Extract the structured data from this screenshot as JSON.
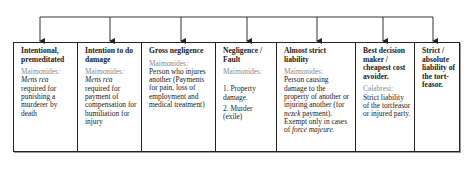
{
  "diagram": {
    "type": "liability-spectrum",
    "connector": {
      "top_line_y": 17,
      "arrow_xs": [
        40,
        110,
        181,
        247,
        317,
        383,
        433
      ]
    },
    "columns": [
      {
        "title": "Intentional, premeditated",
        "source": "Maimonides:",
        "body_italic": "Mens rea",
        "body": "required for punishing a murderer by death"
      },
      {
        "title": "Intention to do damage",
        "source": "Maimonides:",
        "body_italic": "Mens rea",
        "body": "required for payment of compensation for humiliation for injury"
      },
      {
        "title": "Gross negligence",
        "source": "Maimonides:",
        "body": "Person who injures another (Payments for pain, loss of employment and medical treatment)"
      },
      {
        "title": "Negligence / Fault",
        "source": "Maimonides:",
        "items": [
          "1. Property damage.",
          "2. Murder (exile)"
        ]
      },
      {
        "title": "Almost strict liability",
        "source": "Maimonides:",
        "body_pre": "Person causing damage to the property of another or injuring another (for ",
        "body_italic": "nezek",
        "body_post": " payment). Exempt only in cases of ",
        "body_italic2": "force majeure."
      },
      {
        "title": "Best decision maker / cheapest cost avoider.",
        "source": "Calabresi:",
        "body": "Strict liability of the tortfeasor or injured party."
      },
      {
        "title": "Strict / absolute liability of the tort-feasor."
      }
    ]
  }
}
